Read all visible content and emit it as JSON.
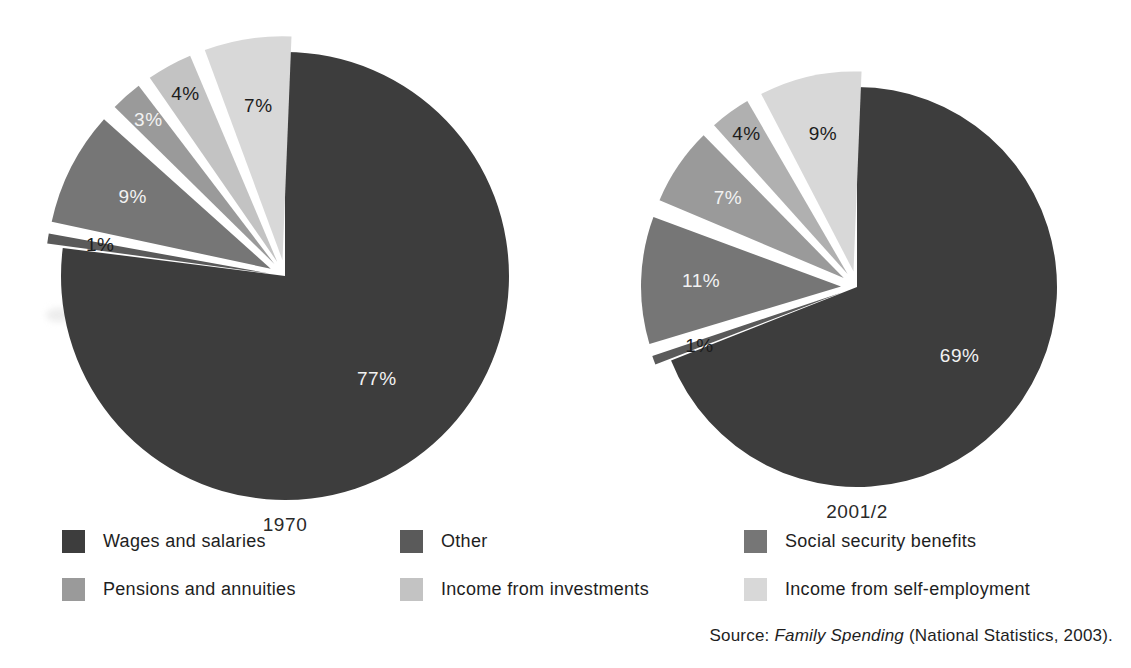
{
  "chart_data": {
    "type": "pie",
    "title": "",
    "legend_position": "bottom",
    "source_note": {
      "prefix": "Source:",
      "italic_part": "Family Spending",
      "suffix": "(National Statistics, 2003)."
    },
    "categories": [
      "Wages and salaries",
      "Other",
      "Social security benefits",
      "Pensions and annuities",
      "Income from investments",
      "Income from self-employment"
    ],
    "colors": {
      "wages_and_salaries": "#3d3d3d",
      "other": "#5a5a5a",
      "social_security_benefits": "#767676",
      "pensions_and_annuities": "#9a9a9a",
      "income_from_investments": "#c3c3c3",
      "income_from_self_employment": "#d8d8d8",
      "background": "#ffffff",
      "label_on_dark": "#f2f2f2",
      "label_on_light": "#1c1c1c"
    },
    "charts": [
      {
        "name": "1970",
        "caption": "1970",
        "center": [
          285,
          276
        ],
        "radius": 224,
        "slices": [
          {
            "category": "Wages and salaries",
            "value": 77,
            "label": "77%",
            "color": "#3d3d3d",
            "label_color": "on-dark",
            "exploded": false
          },
          {
            "category": "Other",
            "value": 1,
            "label": "1%",
            "color": "#5a5a5a",
            "label_color": "on-light",
            "exploded": true
          },
          {
            "category": "Social security benefits",
            "value": 9,
            "label": "9%",
            "color": "#767676",
            "label_color": "on-dark",
            "exploded": true
          },
          {
            "category": "Pensions and annuities",
            "value": 3,
            "label": "3%",
            "color": "#9a9a9a",
            "label_color": "on-dark",
            "exploded": true
          },
          {
            "category": "Income from investments",
            "value": 4,
            "label": "4%",
            "color": "#c3c3c3",
            "label_color": "on-light",
            "exploded": true
          },
          {
            "category": "Income from self-employment",
            "value": 7,
            "label": "7%",
            "color": "#d8d8d8",
            "label_color": "on-light",
            "exploded": true
          }
        ]
      },
      {
        "name": "2001/2",
        "caption": "2001/2",
        "center": [
          857,
          287
        ],
        "radius": 200,
        "slices": [
          {
            "category": "Wages and salaries",
            "value": 69,
            "label": "69%",
            "color": "#3d3d3d",
            "label_color": "on-dark",
            "exploded": false
          },
          {
            "category": "Other",
            "value": 1,
            "label": "1%",
            "color": "#5a5a5a",
            "label_color": "on-light",
            "exploded": true
          },
          {
            "category": "Social security benefits",
            "value": 11,
            "label": "11%",
            "color": "#767676",
            "label_color": "on-dark",
            "exploded": true
          },
          {
            "category": "Income from investments",
            "value": 7,
            "label": "7%",
            "color": "#9a9a9a",
            "label_color": "on-dark",
            "exploded": true
          },
          {
            "category": "Pensions and annuities",
            "value": 4,
            "label": "4%",
            "color": "#b0b0b0",
            "label_color": "on-light",
            "exploded": true
          },
          {
            "category": "Income from self-employment",
            "value": 9,
            "label": "9%",
            "color": "#d8d8d8",
            "label_color": "on-light",
            "exploded": true
          }
        ]
      }
    ]
  },
  "legend": {
    "items": [
      {
        "label": "Wages and salaries",
        "color": "#3d3d3d",
        "col": 1,
        "row": 1
      },
      {
        "label": "Pensions and annuities",
        "color": "#9a9a9a",
        "col": 1,
        "row": 2
      },
      {
        "label": "Other",
        "color": "#5a5a5a",
        "col": 2,
        "row": 1
      },
      {
        "label": "Income from investments",
        "color": "#c3c3c3",
        "col": 2,
        "row": 2
      },
      {
        "label": "Social security benefits",
        "color": "#767676",
        "col": 3,
        "row": 1
      },
      {
        "label": "Income from self-employment",
        "color": "#d8d8d8",
        "col": 3,
        "row": 2
      }
    ]
  }
}
